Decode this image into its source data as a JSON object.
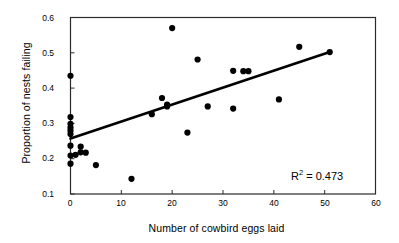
{
  "chart_data": {
    "type": "scatter",
    "title": "",
    "xlabel": "Number of cowbird eggs laid",
    "ylabel": "Proportion of nests failing",
    "xlim": [
      0,
      60
    ],
    "ylim": [
      0.1,
      0.6
    ],
    "xticks": [
      0,
      10,
      20,
      30,
      40,
      50,
      60
    ],
    "xtick_labels": [
      "0",
      "10",
      "20",
      "30",
      "40",
      "50",
      "60"
    ],
    "yticks": [
      0.1,
      0.2,
      0.3,
      0.4,
      0.5,
      0.6
    ],
    "ytick_labels": [
      "0.1",
      "0.2",
      "0.3",
      "0.4",
      "0.5",
      "0.6"
    ],
    "grid": false,
    "legend": null,
    "marker_color": "#000000",
    "marker_size": 3.1,
    "points": [
      {
        "x": 0,
        "y": 0.435
      },
      {
        "x": 0,
        "y": 0.318
      },
      {
        "x": 0,
        "y": 0.299
      },
      {
        "x": 0,
        "y": 0.288
      },
      {
        "x": 0,
        "y": 0.279
      },
      {
        "x": 0,
        "y": 0.27
      },
      {
        "x": 0,
        "y": 0.237
      },
      {
        "x": 0,
        "y": 0.209
      },
      {
        "x": 0,
        "y": 0.186
      },
      {
        "x": 1,
        "y": 0.211
      },
      {
        "x": 2,
        "y": 0.234
      },
      {
        "x": 2,
        "y": 0.218
      },
      {
        "x": 3,
        "y": 0.217
      },
      {
        "x": 5,
        "y": 0.182
      },
      {
        "x": 12,
        "y": 0.143
      },
      {
        "x": 16,
        "y": 0.326
      },
      {
        "x": 18,
        "y": 0.372
      },
      {
        "x": 19,
        "y": 0.353
      },
      {
        "x": 19,
        "y": 0.348
      },
      {
        "x": 20,
        "y": 0.57
      },
      {
        "x": 23,
        "y": 0.274
      },
      {
        "x": 25,
        "y": 0.481
      },
      {
        "x": 27,
        "y": 0.348
      },
      {
        "x": 32,
        "y": 0.342
      },
      {
        "x": 32,
        "y": 0.449
      },
      {
        "x": 34,
        "y": 0.448
      },
      {
        "x": 35,
        "y": 0.448
      },
      {
        "x": 41,
        "y": 0.368
      },
      {
        "x": 45,
        "y": 0.517
      },
      {
        "x": 51,
        "y": 0.502
      }
    ],
    "trendline": {
      "type": "linear",
      "x_start": 0,
      "y_start": 0.257,
      "x_end": 51,
      "y_end": 0.502,
      "color": "#000000",
      "width": 2.6
    },
    "annotations": [
      {
        "name": "r-squared",
        "text": "R2 = 0.473",
        "prefix": "R",
        "superscript": "2",
        "suffix": " = 0.473",
        "x": 291,
        "y": 170
      }
    ]
  }
}
